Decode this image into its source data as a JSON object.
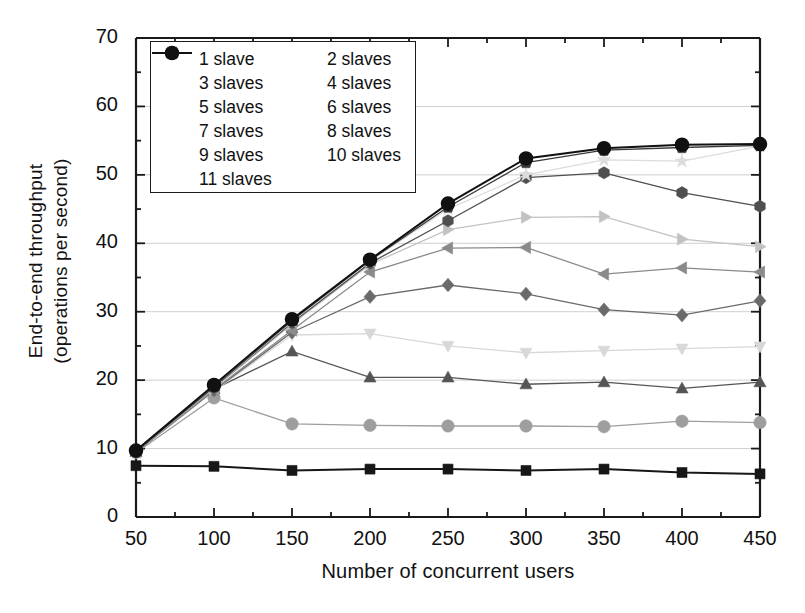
{
  "chart_data": {
    "type": "line",
    "title": "",
    "xlabel": "Number of concurrent users",
    "ylabel_line1": "End-to-end throughput",
    "ylabel_line2": "(operations per second)",
    "x": [
      50,
      100,
      150,
      200,
      250,
      300,
      350,
      400,
      450
    ],
    "xticks": [
      "50",
      "100",
      "150",
      "200",
      "250",
      "300",
      "350",
      "400",
      "450"
    ],
    "yticks": [
      "0",
      "10",
      "20",
      "30",
      "40",
      "50",
      "60",
      "70"
    ],
    "xlim": [
      50,
      450
    ],
    "ylim": [
      0,
      70
    ],
    "grid": true,
    "legend_position": "top-left-inside",
    "series": [
      {
        "name": "1 slave",
        "marker": "square",
        "color": "#171717",
        "values": [
          7.5,
          7.4,
          6.8,
          7.0,
          7.0,
          6.8,
          7.0,
          6.5,
          6.3
        ]
      },
      {
        "name": "2 slaves",
        "marker": "circle",
        "color": "#9e9e9e",
        "values": [
          9.4,
          17.4,
          13.6,
          13.4,
          13.3,
          13.3,
          13.2,
          14.0,
          13.8
        ]
      },
      {
        "name": "3 slaves",
        "marker": "triangle-up",
        "color": "#555555",
        "values": [
          9.5,
          18.7,
          24.2,
          20.4,
          20.4,
          19.4,
          19.7,
          18.8,
          19.7
        ]
      },
      {
        "name": "4 slaves",
        "marker": "triangle-down",
        "color": "#d8d8d8",
        "values": [
          9.5,
          18.4,
          26.6,
          26.8,
          25.0,
          24.0,
          24.3,
          24.6,
          24.9
        ]
      },
      {
        "name": "5 slaves",
        "marker": "diamond",
        "color": "#6a6a6a",
        "values": [
          9.5,
          18.5,
          27.0,
          32.2,
          33.9,
          32.6,
          30.3,
          29.5,
          31.6
        ]
      },
      {
        "name": "6 slaves",
        "marker": "triangle-left",
        "color": "#8a8a8a",
        "values": [
          9.5,
          18.6,
          27.3,
          35.8,
          39.3,
          39.4,
          35.5,
          36.4,
          35.8
        ]
      },
      {
        "name": "7 slaves",
        "marker": "triangle-right",
        "color": "#c2c2c2",
        "values": [
          9.6,
          18.8,
          28.2,
          36.9,
          42.0,
          43.8,
          43.9,
          40.6,
          39.5
        ]
      },
      {
        "name": "8 slaves",
        "marker": "hexagon",
        "color": "#4f4f4f",
        "values": [
          9.6,
          18.9,
          28.4,
          37.1,
          43.3,
          49.6,
          50.3,
          47.4,
          45.4
        ]
      },
      {
        "name": "9 slaves",
        "marker": "star",
        "color": "#dcdcdc",
        "values": [
          9.6,
          18.9,
          28.6,
          37.4,
          45.0,
          50.0,
          52.2,
          52.0,
          54.2
        ]
      },
      {
        "name": "10 slaves",
        "marker": "pentagon",
        "color": "#3a3a3a",
        "values": [
          9.6,
          19.0,
          28.7,
          37.5,
          45.3,
          51.8,
          53.6,
          54.0,
          54.3
        ]
      },
      {
        "name": "11 slaves",
        "marker": "circle-split",
        "color": "#111111",
        "values": [
          9.7,
          19.3,
          28.9,
          37.6,
          45.8,
          52.4,
          53.9,
          54.4,
          54.5
        ]
      }
    ]
  },
  "axis": {
    "y_label_lines": [
      "End-to-end throughput",
      "(operations per second)"
    ],
    "x_label": "Number of concurrent users"
  },
  "legend": {
    "items": [
      "1 slave",
      "2 slaves",
      "3 slaves",
      "4 slaves",
      "5 slaves",
      "6 slaves",
      "7 slaves",
      "8 slaves",
      "9 slaves",
      "10 slaves",
      "11 slaves"
    ]
  },
  "colors": {
    "axis": "#1a1a1a",
    "grid": "#c9c9c9",
    "background": "#ffffff"
  }
}
